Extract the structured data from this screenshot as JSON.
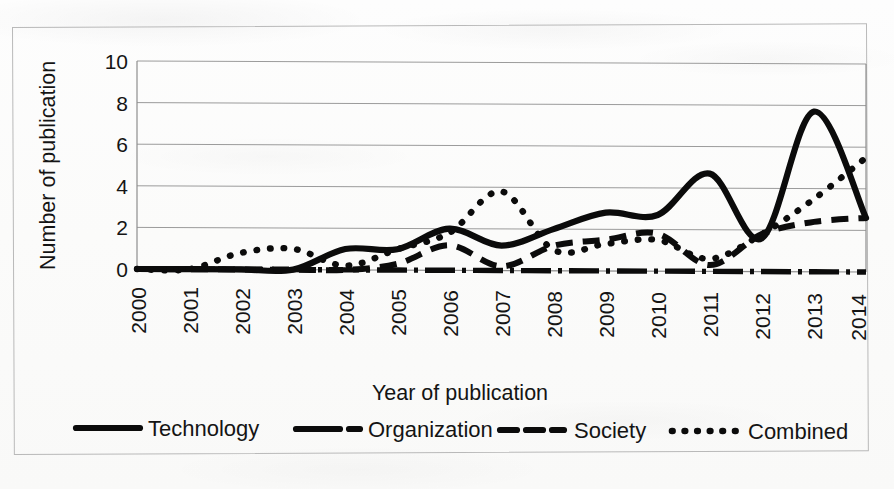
{
  "chart_data": {
    "type": "line",
    "title": "",
    "xlabel": "Year of publication",
    "ylabel": "Number of publication",
    "x": [
      2000,
      2001,
      2002,
      2003,
      2004,
      2005,
      2006,
      2007,
      2008,
      2009,
      2010,
      2011,
      2012,
      2013,
      2014
    ],
    "xtick_labels": [
      "2000",
      "2001",
      "2002",
      "2003",
      "2004",
      "2005",
      "2006",
      "2007",
      "2008",
      "2009",
      "2010",
      "2011",
      "2012",
      "2013",
      "2014"
    ],
    "ytick_labels": [
      "0",
      "2",
      "4",
      "6",
      "8",
      "10"
    ],
    "ytick_values": [
      0,
      2,
      4,
      6,
      8,
      10
    ],
    "ylim": [
      0,
      10
    ],
    "xlim": [
      2000,
      2014
    ],
    "grid": "horizontal",
    "legend_position": "bottom",
    "smoothed": true,
    "series": [
      {
        "name": "Technology",
        "style": "solid",
        "color": "#0b0b0b",
        "values": [
          0,
          0,
          0,
          0,
          1,
          1,
          2,
          1.2,
          2,
          2.8,
          2.7,
          4.7,
          1.6,
          7.7,
          2.6
        ]
      },
      {
        "name": "Organization",
        "style": "dash-dot",
        "color": "#0b0b0b",
        "values": [
          0,
          0,
          0,
          0,
          0,
          0,
          0,
          0,
          0,
          0,
          0,
          0,
          0,
          0,
          0
        ]
      },
      {
        "name": "Society",
        "style": "dashed",
        "color": "#0b0b0b",
        "values": [
          0,
          0,
          0,
          0,
          0,
          0.3,
          1.2,
          0.2,
          1.2,
          1.5,
          1.8,
          0.3,
          1.8,
          2.4,
          2.6
        ]
      },
      {
        "name": "Combined",
        "style": "dotted",
        "color": "#0b0b0b",
        "values": [
          0,
          0,
          0.8,
          1,
          0.2,
          1,
          1.8,
          3.8,
          1,
          1.3,
          1.5,
          0.6,
          1.8,
          3.5,
          5.5
        ]
      }
    ]
  },
  "axes": {
    "y_title": "Number of publication",
    "x_title": "Year of publication"
  },
  "legend": {
    "items": [
      {
        "label": "Technology",
        "style": "solid"
      },
      {
        "label": "Organization",
        "style": "dash-dot"
      },
      {
        "label": "Society",
        "style": "dashed"
      },
      {
        "label": "Combined",
        "style": "dotted"
      }
    ]
  }
}
